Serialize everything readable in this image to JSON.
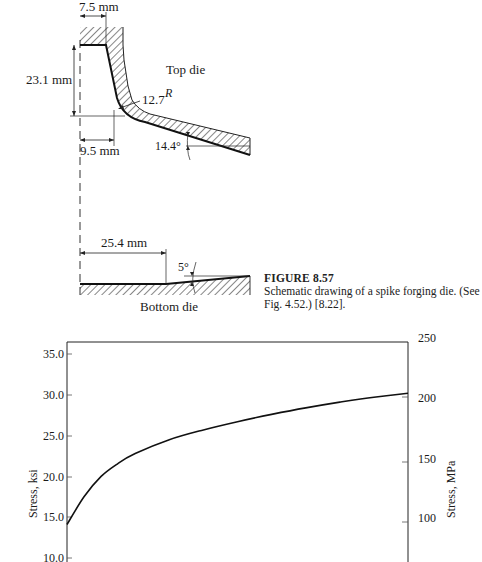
{
  "diagram": {
    "labels": {
      "top_width": "7.5 mm",
      "height": "23.1 mm",
      "base_offset": "9.5 mm",
      "radius": "12.7",
      "radius_sup": "R",
      "top_angle": "14.4°",
      "top_die": "Top die",
      "bottom_length": "25.4 mm",
      "bottom_angle": "5°",
      "bottom_die": "Bottom die"
    }
  },
  "caption": {
    "title": "FIGURE 8.57",
    "text": "Schematic drawing of a spike forging die. (See Fig. 4.52.) [8.22]."
  },
  "chart_data": {
    "type": "line",
    "title": "",
    "xlabel": "",
    "ylabel": "Stress, ksi",
    "ylabel_right": "Stress, MPa",
    "yticks_left": [
      "35.0",
      "30.0",
      "25.0",
      "20.0",
      "15.0",
      "10.0"
    ],
    "yticks_right": [
      "250",
      "200",
      "150",
      "100"
    ],
    "ylim_left": [
      10.0,
      36.0
    ],
    "ylim_right": [
      70,
      250
    ],
    "series": [
      {
        "name": "stress",
        "x_rel": [
          0.0,
          0.05,
          0.1,
          0.15,
          0.2,
          0.3,
          0.4,
          0.5,
          0.6,
          0.7,
          0.8,
          0.9,
          1.0
        ],
        "values": [
          14.1,
          17.5,
          20.0,
          21.6,
          22.8,
          24.5,
          25.7,
          26.7,
          27.6,
          28.4,
          29.1,
          29.7,
          30.2
        ]
      }
    ],
    "grid": false
  }
}
